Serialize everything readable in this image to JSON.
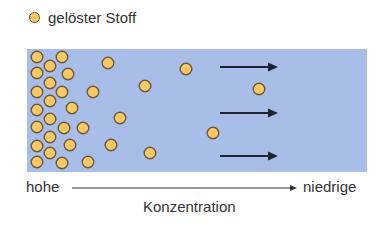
{
  "legend": {
    "label": "gelöster Stoff",
    "marker_color": "#f8c768",
    "marker_stroke": "#6b5a3a"
  },
  "container": {
    "color": "#a9bde9",
    "x": 27,
    "y": 49,
    "width": 340,
    "height": 123
  },
  "particles": [
    [
      37,
      57
    ],
    [
      62,
      57
    ],
    [
      50,
      66
    ],
    [
      37,
      73
    ],
    [
      68,
      74
    ],
    [
      50,
      83
    ],
    [
      37,
      92
    ],
    [
      62,
      92
    ],
    [
      50,
      101
    ],
    [
      37,
      110
    ],
    [
      72,
      108
    ],
    [
      50,
      119
    ],
    [
      37,
      127
    ],
    [
      64,
      128
    ],
    [
      83,
      128
    ],
    [
      50,
      137
    ],
    [
      37,
      146
    ],
    [
      70,
      145
    ],
    [
      50,
      153
    ],
    [
      37,
      162
    ],
    [
      62,
      163
    ],
    [
      88,
      162
    ],
    [
      108,
      63
    ],
    [
      93,
      92
    ],
    [
      120,
      118
    ],
    [
      111,
      145
    ],
    [
      186,
      69
    ],
    [
      145,
      86
    ],
    [
      213,
      133
    ],
    [
      150,
      153
    ],
    [
      259,
      89
    ]
  ],
  "arrows": [
    {
      "x1": 220,
      "x2": 278,
      "y": 67
    },
    {
      "x1": 220,
      "x2": 278,
      "y": 113
    },
    {
      "x1": 220,
      "x2": 278,
      "y": 156
    }
  ],
  "axis": {
    "start_label": "hohe",
    "end_label": "niedrige",
    "title": "Konzentration",
    "line": {
      "x1": 72,
      "x2": 297,
      "y": 188
    }
  }
}
